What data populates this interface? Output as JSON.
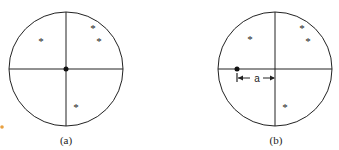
{
  "diagram": {
    "panels": [
      {
        "label": "(a)",
        "circle": {
          "cx": 66,
          "cy": 69,
          "r": 57
        },
        "center_dot": {
          "x": 66,
          "y": 69
        },
        "stars": [
          {
            "x": 41,
            "y": 42
          },
          {
            "x": 93,
            "y": 29
          },
          {
            "x": 99,
            "y": 42
          },
          {
            "x": 76,
            "y": 108
          }
        ]
      },
      {
        "label": "(b)",
        "circle": {
          "cx": 275,
          "cy": 69,
          "r": 57
        },
        "offset_dot": {
          "x": 237,
          "y": 69
        },
        "stars": [
          {
            "x": 250,
            "y": 40
          },
          {
            "x": 302,
            "y": 29
          },
          {
            "x": 308,
            "y": 42
          },
          {
            "x": 285,
            "y": 108
          }
        ],
        "dimension": {
          "label": "a",
          "from_x": 237,
          "to_x": 275,
          "y": 78
        }
      }
    ],
    "colors": {
      "line": "#222222",
      "accent_dot": "#e8a040"
    }
  }
}
